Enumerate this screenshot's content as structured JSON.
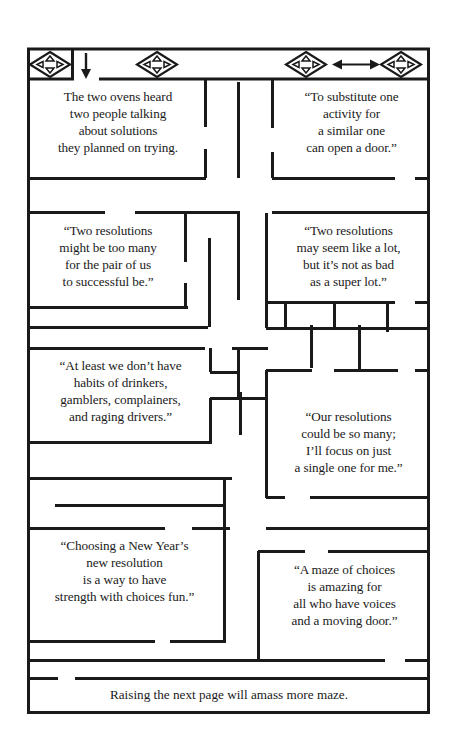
{
  "page": {
    "background_color": "#ffffff",
    "ink_color": "#1a1a1a",
    "width": 455,
    "height": 754
  },
  "icons": {
    "entrance_move_icon": "move-diamond-icon",
    "down_arrow_icon": "down-arrow-icon",
    "top_middle_move_icon": "move-diamond-icon",
    "top_right_move_icon_left": "move-diamond-icon",
    "double_arrow_icon": "left-right-arrow-icon",
    "top_right_move_icon_right": "move-diamond-icon"
  },
  "cells": [
    {
      "id": "cell-oven",
      "lines": [
        "The two ovens heard",
        "two people talking",
        "about solutions",
        "they planned on trying."
      ]
    },
    {
      "id": "cell-substitute",
      "lines": [
        "“To substitute one",
        "activity for",
        "a similar one",
        "can open a door.”"
      ]
    },
    {
      "id": "cell-two-resolutions-many",
      "lines": [
        "“Two resolutions",
        "might be too many",
        "for the pair of us",
        "to successful be.”"
      ]
    },
    {
      "id": "cell-two-resolutions-lot",
      "lines": [
        "“Two resolutions",
        "may seem like a lot,",
        "but it’s not as bad",
        "as a super lot.”"
      ]
    },
    {
      "id": "cell-at-least",
      "lines": [
        "“At least we don’t have",
        "habits of drinkers,",
        "gamblers, complainers,",
        "and raging drivers.”"
      ]
    },
    {
      "id": "cell-our-resolutions",
      "lines": [
        "“Our resolutions",
        "could be so many;",
        "I’ll focus on just",
        "a single one for me.”"
      ]
    },
    {
      "id": "cell-choosing",
      "lines": [
        "“Choosing a New Year’s",
        "new resolution",
        "is a way to have",
        "strength with choices fun.”"
      ]
    },
    {
      "id": "cell-maze-of-choices",
      "lines": [
        "“A maze of choices",
        "is amazing for",
        "all who have voices",
        "and a moving door.”"
      ]
    }
  ],
  "footer": {
    "text": "Raising the next page will amass more maze."
  }
}
